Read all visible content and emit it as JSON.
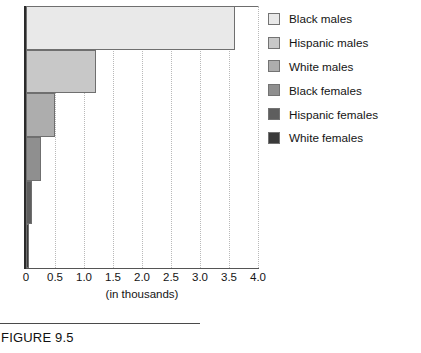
{
  "figure": {
    "caption": "FIGURE 9.5"
  },
  "chart_data": {
    "type": "bar",
    "orientation": "horizontal",
    "title": "",
    "xlabel": "(in thousands)",
    "ylabel": "",
    "xlim": [
      0,
      4.0
    ],
    "xticks": [
      "0",
      "0.5",
      "1.0",
      "1.5",
      "2.0",
      "2.5",
      "3.0",
      "3.5",
      "4.0"
    ],
    "xtick_values": [
      0,
      0.5,
      1.0,
      1.5,
      2.0,
      2.5,
      3.0,
      3.5,
      4.0
    ],
    "grid": true,
    "grid_style": "dotted-vertical",
    "legend_position": "right",
    "categories": [
      "Black males",
      "Hispanic males",
      "White males",
      "Black females",
      "Hispanic females",
      "White females"
    ],
    "values": [
      3.6,
      1.2,
      0.5,
      0.25,
      0.1,
      0.05
    ],
    "colors": [
      "#e9e9e9",
      "#c8c8c8",
      "#adadad",
      "#8f8f8f",
      "#5e5e5e",
      "#3a3a3a"
    ]
  },
  "legend": {
    "items": [
      {
        "label": "Black males",
        "color": "#e9e9e9"
      },
      {
        "label": "Hispanic males",
        "color": "#c8c8c8"
      },
      {
        "label": "White males",
        "color": "#adadad"
      },
      {
        "label": "Black females",
        "color": "#8f8f8f"
      },
      {
        "label": "Hispanic females",
        "color": "#5e5e5e"
      },
      {
        "label": "White females",
        "color": "#3a3a3a"
      }
    ]
  }
}
